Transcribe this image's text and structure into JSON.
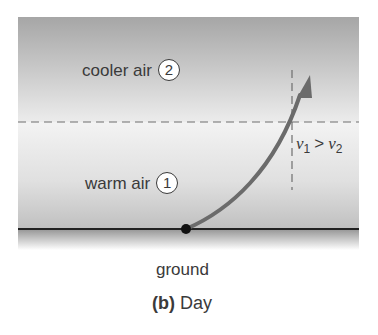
{
  "diagram": {
    "layers": {
      "upper": {
        "label": "cooler air",
        "number": "2"
      },
      "lower": {
        "label": "warm air",
        "number": "1"
      }
    },
    "relation": {
      "v1": "v",
      "v1_sub": "1",
      "op": ">",
      "v2": "v",
      "v2_sub": "2"
    },
    "ground_label": "ground",
    "caption": {
      "letter": "(b)",
      "text": "Day"
    },
    "colors": {
      "upper_top": "#a9a9a9",
      "upper_bottom": "#e8e8e8",
      "lower_top": "#f2f2f2",
      "lower_bottom": "#c4c4c4",
      "arrow": "#6b6b6b",
      "ground_line": "#222222"
    }
  }
}
